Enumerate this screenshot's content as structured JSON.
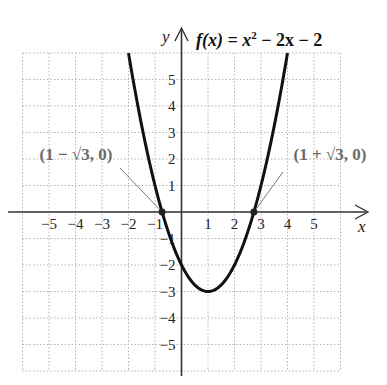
{
  "chart_data": {
    "type": "line",
    "title_parts": {
      "fx": "f(x) = x",
      "sup": "2",
      "rest": " − 2x − 2"
    },
    "xlabel": "x",
    "ylabel": "y",
    "xlim": [
      -6,
      6
    ],
    "ylim": [
      -6,
      6
    ],
    "grid": true,
    "x_ticks": [
      -5,
      -4,
      -3,
      -2,
      -1,
      1,
      2,
      3,
      4,
      5
    ],
    "y_ticks": [
      -5,
      -4,
      -3,
      -2,
      -1,
      1,
      2,
      3,
      4,
      5
    ],
    "x_tick_labels": [
      "−5",
      "−4",
      "−3",
      "−2",
      "−1",
      "1",
      "2",
      "3",
      "4",
      "5"
    ],
    "y_tick_labels": [
      "−5",
      "−4",
      "−3",
      "−2",
      "−1",
      "1",
      "2",
      "3",
      "4",
      "5"
    ],
    "series": [
      {
        "name": "f(x) = x^2 - 2x - 2",
        "function": "x^2 - 2x - 2",
        "x": [
          -2,
          -1.5,
          -1,
          -0.732,
          -0.5,
          0,
          0.5,
          1,
          1.5,
          2,
          2.5,
          2.732,
          3,
          3.5,
          4
        ],
        "values": [
          6,
          3.25,
          1,
          0,
          -0.75,
          -2,
          -2.75,
          -3,
          -2.75,
          -2,
          -0.75,
          0,
          1,
          3.25,
          6
        ],
        "color": "#111111"
      }
    ],
    "annotations": [
      {
        "label": "(1 − √3, 0)",
        "x": -0.732,
        "y": 0
      },
      {
        "label": "(1 + √3, 0)",
        "x": 2.732,
        "y": 0
      }
    ],
    "key_points": {
      "vertex": [
        1,
        -3
      ],
      "y_intercept": [
        0,
        -2
      ]
    }
  }
}
